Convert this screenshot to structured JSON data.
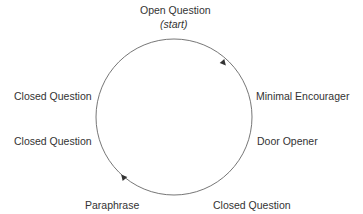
{
  "diagram": {
    "type": "cycle",
    "direction": "clockwise",
    "colors": {
      "line": "#666666",
      "text": "#333333",
      "background": "#ffffff"
    },
    "nodes": [
      {
        "label": "Open Question",
        "note": "(start)",
        "position": "top"
      },
      {
        "label": "Minimal Encourager",
        "position": "right-upper"
      },
      {
        "label": "Door Opener",
        "position": "right-lower"
      },
      {
        "label": "Closed Question",
        "position": "bottom-right"
      },
      {
        "label": "Paraphrase",
        "position": "bottom-left"
      },
      {
        "label": "Closed Question",
        "position": "left-lower"
      },
      {
        "label": "Closed Question",
        "position": "left-upper"
      }
    ],
    "arrows": [
      {
        "location": "upper-right arc",
        "direction": "clockwise"
      },
      {
        "location": "lower-left arc",
        "direction": "clockwise"
      }
    ]
  }
}
